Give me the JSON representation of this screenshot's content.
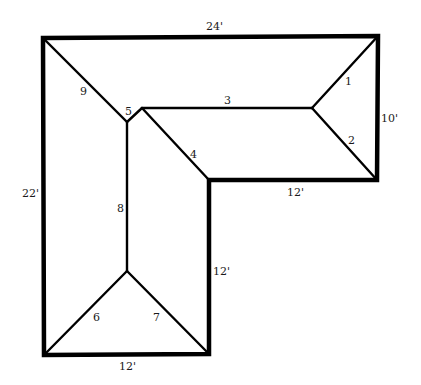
{
  "diagram": {
    "type": "L-shaped hip roof plan",
    "dimensions": {
      "top": "24'",
      "left": "22'",
      "right": "10'",
      "inner_bottom_right": "12'",
      "inner_vertical": "12'",
      "bottom": "12'"
    },
    "numbered_lines": [
      "1",
      "2",
      "3",
      "4",
      "5",
      "6",
      "7",
      "8",
      "9"
    ],
    "line_color": "#000000"
  }
}
